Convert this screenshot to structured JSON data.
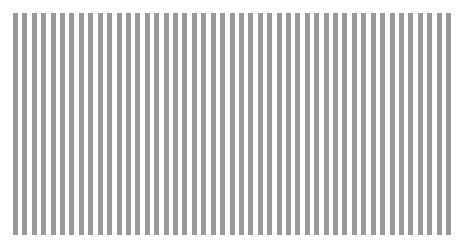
{
  "chart_data": {
    "type": "bar",
    "title": "",
    "xlabel": "",
    "ylabel": "",
    "categories": [
      "1",
      "2",
      "3",
      "4",
      "5",
      "6",
      "7",
      "8",
      "9",
      "10",
      "11",
      "12",
      "13",
      "14",
      "15",
      "16",
      "17",
      "18",
      "19",
      "20",
      "21",
      "22",
      "23",
      "24",
      "25",
      "26",
      "27",
      "28",
      "29",
      "30",
      "31",
      "32",
      "33",
      "34",
      "35",
      "36",
      "37",
      "38",
      "39",
      "40",
      "41",
      "42",
      "43",
      "44",
      "45",
      "46",
      "47"
    ],
    "values": [
      1,
      1,
      1,
      1,
      1,
      1,
      1,
      1,
      1,
      1,
      1,
      1,
      1,
      1,
      1,
      1,
      1,
      1,
      1,
      1,
      1,
      1,
      1,
      1,
      1,
      1,
      1,
      1,
      1,
      1,
      1,
      1,
      1,
      1,
      1,
      1,
      1,
      1,
      1,
      1,
      1,
      1,
      1,
      1,
      1,
      1,
      1
    ],
    "ylim": [
      0,
      1
    ],
    "grid": false,
    "legend": null,
    "bar_color": "#999999"
  }
}
